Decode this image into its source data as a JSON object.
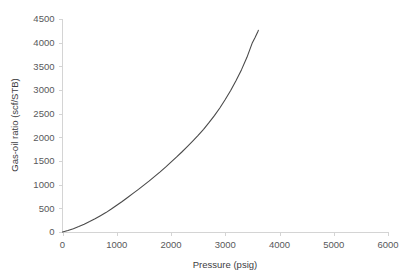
{
  "chart_data": {
    "type": "line",
    "title": "",
    "xlabel": "Pressure (psig)",
    "ylabel": "Gas-oil ratio (scf/STB)",
    "xlim": [
      0,
      6000
    ],
    "ylim": [
      0,
      4500
    ],
    "xticks": [
      0,
      1000,
      2000,
      3000,
      4000,
      5000,
      6000
    ],
    "yticks": [
      0,
      500,
      1000,
      1500,
      2000,
      2500,
      3000,
      3500,
      4000,
      4500
    ],
    "xtick_labels": [
      "0",
      "1000",
      "2000",
      "3000",
      "4000",
      "5000",
      "6000"
    ],
    "ytick_labels": [
      "0",
      "500",
      "1000",
      "1500",
      "2000",
      "2500",
      "3000",
      "3500",
      "4000",
      "4500"
    ],
    "grid": false,
    "legend": false,
    "legend_position": "none",
    "line_color": "#4a4a4a",
    "axis_color": "#d4d4d4",
    "text_color": "#58595b",
    "series": [
      {
        "name": "Gas-oil ratio",
        "x": [
          0,
          100,
          200,
          300,
          400,
          500,
          600,
          700,
          800,
          900,
          1000,
          1100,
          1200,
          1300,
          1400,
          1500,
          1600,
          1700,
          1800,
          1900,
          2000,
          2100,
          2200,
          2300,
          2400,
          2500,
          2600,
          2700,
          2800,
          2900,
          3000,
          3100,
          3200,
          3300,
          3400,
          3500,
          3550,
          3600,
          3610
        ],
        "values": [
          0,
          30,
          70,
          115,
          165,
          220,
          280,
          345,
          410,
          485,
          565,
          645,
          730,
          815,
          900,
          990,
          1080,
          1175,
          1270,
          1370,
          1475,
          1580,
          1690,
          1805,
          1920,
          2040,
          2170,
          2310,
          2460,
          2620,
          2800,
          2990,
          3200,
          3430,
          3690,
          4000,
          4110,
          4230,
          4260
        ]
      }
    ]
  },
  "axis": {
    "x_title": "Pressure (psig)",
    "y_title": "Gas-oil ratio (scf/STB)"
  }
}
